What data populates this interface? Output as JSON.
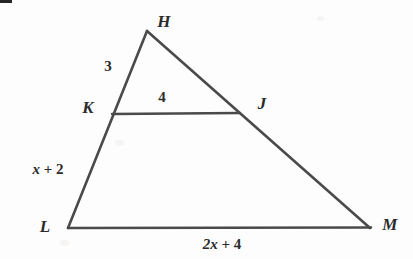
{
  "figure": {
    "type": "geometry-diagram",
    "shape": "triangle with midsegment",
    "background_color": "#fdfdfd",
    "stroke_color": "#4a4a4a",
    "label_color": "#2b2b2b",
    "canvas": {
      "width": 413,
      "height": 259
    }
  },
  "vertices": [
    {
      "id": "H",
      "label": "H",
      "x": 147,
      "y": 31,
      "label_x": 164,
      "label_y": 21
    },
    {
      "id": "K",
      "label": "K",
      "x": 112,
      "y": 113,
      "label_x": 88,
      "label_y": 107
    },
    {
      "id": "J",
      "label": "J",
      "x": 239,
      "y": 113,
      "label_x": 262,
      "label_y": 103
    },
    {
      "id": "L",
      "label": "L",
      "x": 68,
      "y": 228,
      "label_x": 45,
      "label_y": 226
    },
    {
      "id": "M",
      "label": "M",
      "x": 370,
      "y": 228,
      "label_x": 390,
      "label_y": 224
    }
  ],
  "segments": [
    {
      "id": "HL",
      "from": "H",
      "to": "L",
      "note": "left side through K"
    },
    {
      "id": "HM",
      "from": "H",
      "to": "M",
      "note": "right side through J"
    },
    {
      "id": "LM",
      "from": "L",
      "to": "M",
      "note": "base"
    },
    {
      "id": "KJ",
      "from": "K",
      "to": "J",
      "note": "midsegment parallel to base"
    }
  ],
  "measures": [
    {
      "id": "HK",
      "text": "3",
      "var": "",
      "suffix": "",
      "x": 108,
      "y": 66,
      "describes": "segment H to K"
    },
    {
      "id": "KJ",
      "text": "4",
      "var": "",
      "suffix": "",
      "x": 162,
      "y": 97,
      "describes": "segment K to J"
    },
    {
      "id": "KL",
      "text": "x + 2",
      "var": "x",
      "suffix": " + 2",
      "x": 48,
      "y": 169,
      "describes": "segment K to L"
    },
    {
      "id": "LM",
      "text": "2x + 4",
      "var": "2x",
      "suffix": " + 4",
      "x": 222,
      "y": 244,
      "describes": "segment L to M"
    }
  ]
}
